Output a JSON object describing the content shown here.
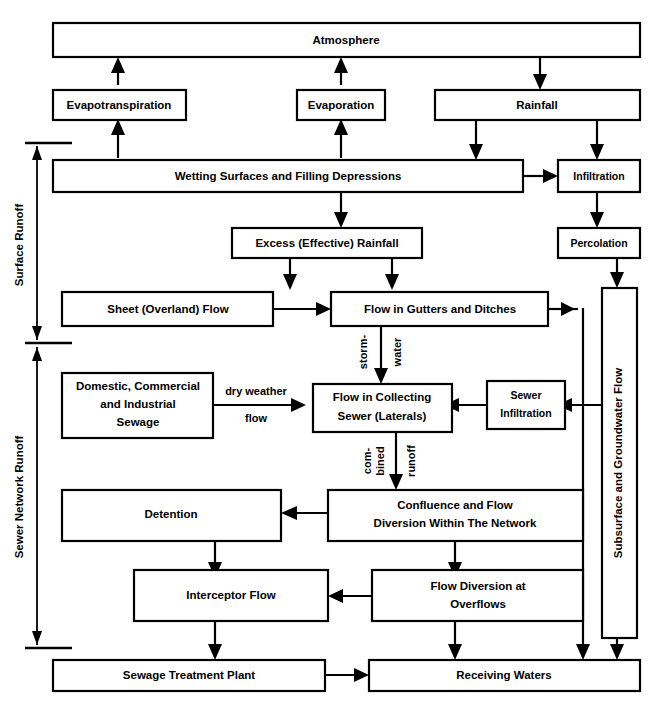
{
  "diagram": {
    "colors": {
      "stroke": "#000000",
      "fill": "#ffffff",
      "background": "#ffffff"
    },
    "nodes": {
      "atmosphere": "Atmosphere",
      "evapotranspiration": "Evapotranspiration",
      "evaporation": "Evaporation",
      "rainfall": "Rainfall",
      "wetting_surfaces": "Wetting Surfaces and Filling Depressions",
      "infiltration": "Infiltration",
      "excess_rainfall": "Excess (Effective) Rainfall",
      "percolation": "Percolation",
      "sheet_flow": "Sheet (Overland) Flow",
      "gutters_ditches": "Flow in Gutters and Ditches",
      "subsurface_groundwater": "Subsurface and Groundwater Flow",
      "sewage_sources_line1": "Domestic, Commercial",
      "sewage_sources_line2": "and Industrial",
      "sewage_sources_line3": "Sewage",
      "collecting_sewer_line1": "Flow in Collecting",
      "collecting_sewer_line2": "Sewer (Laterals)",
      "sewer_infiltration_line1": "Sewer",
      "sewer_infiltration_line2": "Infiltration",
      "detention": "Detention",
      "confluence_line1": "Confluence and Flow",
      "confluence_line2": "Diversion Within The Network",
      "interceptor_flow": "Interceptor Flow",
      "flow_diversion_line1": "Flow Diversion at",
      "flow_diversion_line2": "Overflows",
      "sewage_treatment_plant": "Sewage Treatment Plant",
      "receiving_waters": "Receiving Waters"
    },
    "edge_labels": {
      "dry_weather_top": "dry weather",
      "dry_weather_bottom": "flow",
      "storm_left": "storm-",
      "storm_right": "water",
      "combined_left_line1": "com-",
      "combined_left_line2": "bined",
      "combined_right": "runoff"
    },
    "brackets": {
      "surface_runoff": "Surface Runoff",
      "sewer_network_runoff": "Sewer Network Runoff"
    }
  }
}
